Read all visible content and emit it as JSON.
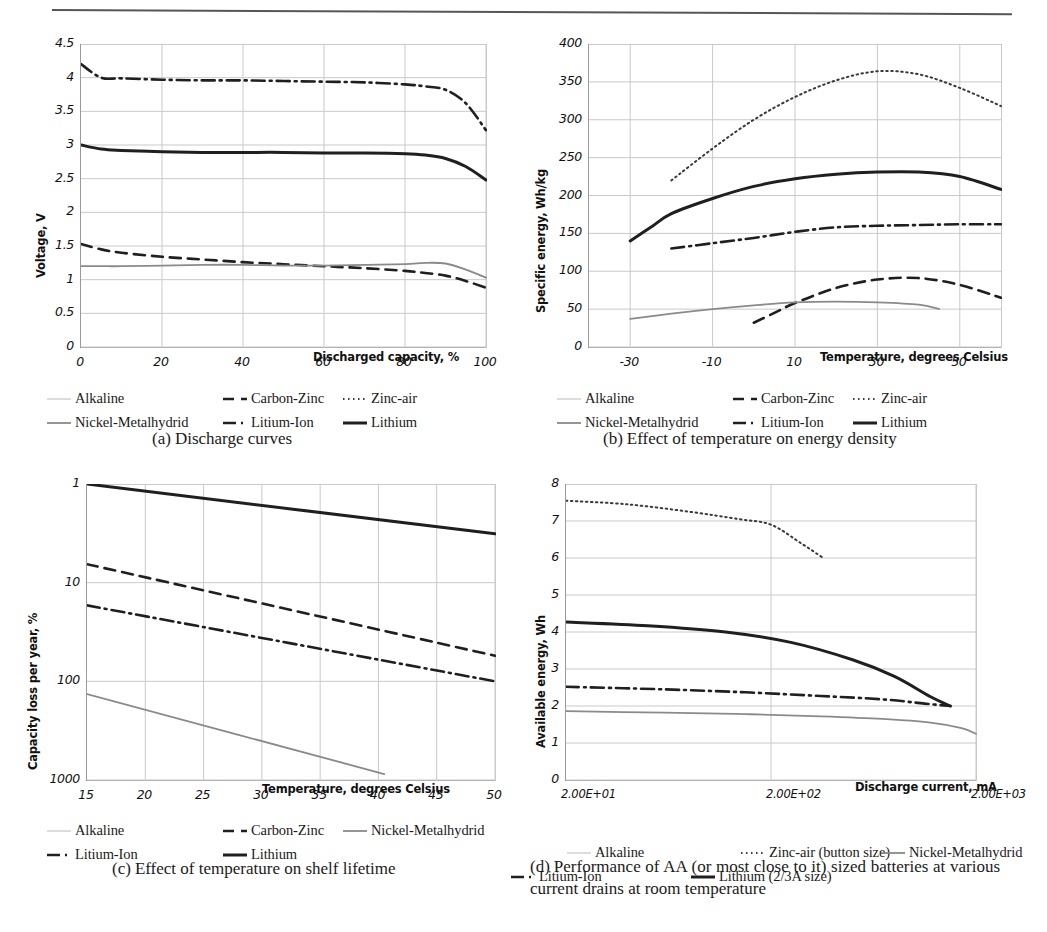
{
  "figure": {
    "has_top_rule": true,
    "colors": {
      "ink": "#1a1a1a",
      "grid": "#c9c9c9",
      "axis": "#9a9a9a",
      "dark_series": "#1f1f1f",
      "grey_series": "#8a8a8a"
    }
  },
  "series_styles": {
    "Alkaline": "faint-solid",
    "Carbon-Zinc": "dashed",
    "Zinc-air": "dotted",
    "Nickel-Metalhydrid": "grey-solid",
    "Litium-Ion": "dash-dot",
    "Lithium": "thick-solid"
  },
  "panels": [
    {
      "key": "a",
      "caption_index": "(a)",
      "caption_text": "Discharge curves",
      "legend": [
        {
          "label": "Alkaline",
          "style": "faint-solid"
        },
        {
          "label": "Carbon-Zinc",
          "style": "dashed"
        },
        {
          "label": "Zinc-air",
          "style": "dotted"
        },
        {
          "label": "Nickel-Metalhydrid",
          "style": "grey-solid"
        },
        {
          "label": "Litium-Ion",
          "style": "dash-dot"
        },
        {
          "label": "Lithium",
          "style": "thick-solid"
        }
      ],
      "chart_data": {
        "type": "line",
        "title": "",
        "xlabel": "Discharged capacity, %",
        "ylabel": "Voltage, V",
        "xlim": [
          0,
          100
        ],
        "ylim": [
          0,
          4.5
        ],
        "xticks": [
          0,
          20,
          40,
          60,
          80,
          100
        ],
        "yticks": [
          0,
          0.5,
          1,
          1.5,
          2,
          2.5,
          3,
          3.5,
          4,
          4.5
        ],
        "grid": true,
        "legend_position": "below",
        "x": [
          0,
          5,
          10,
          20,
          30,
          40,
          50,
          60,
          70,
          80,
          85,
          90,
          95,
          100
        ],
        "series": [
          {
            "name": "Litium-Ion",
            "style": "dash-dot",
            "values": [
              4.2,
              4.0,
              3.99,
              3.97,
              3.96,
              3.96,
              3.95,
              3.94,
              3.93,
              3.9,
              3.87,
              3.82,
              3.62,
              3.22
            ]
          },
          {
            "name": "Lithium",
            "style": "thick-solid",
            "values": [
              3.0,
              2.94,
              2.92,
              2.9,
              2.89,
              2.89,
              2.89,
              2.88,
              2.88,
              2.87,
              2.85,
              2.8,
              2.68,
              2.48
            ]
          },
          {
            "name": "Carbon-Zinc",
            "style": "dashed",
            "values": [
              1.53,
              1.45,
              1.4,
              1.34,
              1.3,
              1.26,
              1.23,
              1.2,
              1.17,
              1.13,
              1.1,
              1.06,
              0.98,
              0.88
            ]
          },
          {
            "name": "Nickel-Metalhydrid",
            "style": "grey-solid",
            "values": [
              1.2,
              1.2,
              1.2,
              1.21,
              1.22,
              1.22,
              1.21,
              1.21,
              1.22,
              1.23,
              1.25,
              1.24,
              1.15,
              1.03
            ]
          }
        ]
      }
    },
    {
      "key": "b",
      "caption_index": "(b)",
      "caption_text": "Effect of temperature on energy density",
      "legend": [
        {
          "label": "Alkaline",
          "style": "faint-solid"
        },
        {
          "label": "Carbon-Zinc",
          "style": "dashed"
        },
        {
          "label": "Zinc-air",
          "style": "dotted"
        },
        {
          "label": "Nickel-Metalhydrid",
          "style": "grey-solid"
        },
        {
          "label": "Litium-Ion",
          "style": "dash-dot"
        },
        {
          "label": "Lithium",
          "style": "thick-solid"
        }
      ],
      "chart_data": {
        "type": "line",
        "title": "",
        "xlabel": "Temperature, degrees Celsius",
        "ylabel": "Specific energy, Wh/kg",
        "xlim": [
          -40,
          60
        ],
        "ylim": [
          0,
          400
        ],
        "xticks": [
          -30,
          -10,
          10,
          30,
          50
        ],
        "yticks": [
          0,
          50,
          100,
          150,
          200,
          250,
          300,
          350,
          400
        ],
        "grid": true,
        "legend_position": "below",
        "series": [
          {
            "name": "Zinc-air",
            "style": "dotted",
            "x": [
              -20,
              -10,
              0,
              10,
              20,
              30,
              40,
              50,
              60
            ],
            "values": [
              220,
              262,
              300,
              330,
              352,
              364,
              360,
              342,
              318
            ]
          },
          {
            "name": "Lithium",
            "style": "thick-solid",
            "x": [
              -30,
              -25,
              -20,
              -10,
              0,
              10,
              20,
              30,
              40,
              50,
              60
            ],
            "values": [
              140,
              158,
              176,
              196,
              212,
              222,
              228,
              231,
              231,
              225,
              208
            ]
          },
          {
            "name": "Litium-Ion",
            "style": "dash-dot",
            "x": [
              -20,
              -10,
              0,
              10,
              20,
              30,
              40,
              50,
              60
            ],
            "values": [
              130,
              137,
              144,
              152,
              158,
              160,
              161,
              162,
              162
            ]
          },
          {
            "name": "Carbon-Zinc",
            "style": "dashed",
            "x": [
              0,
              5,
              10,
              20,
              30,
              40,
              50,
              60
            ],
            "values": [
              32,
              45,
              58,
              78,
              89,
              91,
              82,
              65
            ]
          },
          {
            "name": "Nickel-Metalhydrid",
            "style": "grey-solid",
            "x": [
              -30,
              -20,
              -10,
              0,
              10,
              20,
              30,
              40,
              45
            ],
            "values": [
              37,
              44,
              50,
              55,
              59,
              60,
              59,
              56,
              50
            ]
          }
        ]
      }
    },
    {
      "key": "c",
      "caption_index": "(c)",
      "caption_text": "Effect of temperature on shelf lifetime",
      "legend": [
        {
          "label": "Alkaline",
          "style": "faint-solid"
        },
        {
          "label": "Carbon-Zinc",
          "style": "dashed"
        },
        {
          "label": "Nickel-Metalhydrid",
          "style": "grey-solid"
        },
        {
          "label": "Litium-Ion",
          "style": "dash-dot"
        },
        {
          "label": "Lithium",
          "style": "thick-solid"
        }
      ],
      "chart_data": {
        "type": "line",
        "title": "",
        "xlabel": "Temperature, degrees Celsius",
        "ylabel": "Capacity loss per year, %",
        "xlim": [
          15,
          50
        ],
        "ylim": [
          1,
          1000
        ],
        "yscale": "log-inverted",
        "xticks": [
          15,
          20,
          25,
          30,
          35,
          40,
          45,
          50
        ],
        "yticks": [
          1,
          10,
          100,
          1000
        ],
        "grid": true,
        "legend_position": "below",
        "series": [
          {
            "name": "Lithium",
            "style": "thick-solid",
            "x": [
              15,
              50
            ],
            "values": [
              1.0,
              3.2
            ]
          },
          {
            "name": "Carbon-Zinc",
            "style": "dashed",
            "x": [
              15,
              50
            ],
            "values": [
              6.5,
              55
            ]
          },
          {
            "name": "Litium-Ion",
            "style": "dash-dot",
            "x": [
              15,
              50
            ],
            "values": [
              17,
              100
            ]
          },
          {
            "name": "Nickel-Metalhydrid",
            "style": "grey-solid",
            "x": [
              15,
              40.5
            ],
            "values": [
              135,
              870
            ]
          }
        ]
      }
    },
    {
      "key": "d",
      "caption_index": "(d)",
      "caption_text": "Performance of AA (or most close to it) sized batteries at various current drains at room temperature",
      "legend": [
        {
          "label": "Alkaline",
          "style": "faint-solid"
        },
        {
          "label": "Zinc-air (button size)",
          "style": "dotted"
        },
        {
          "label": "Nickel-Metalhydrid",
          "style": "grey-solid"
        },
        {
          "label": "Litium-Ion",
          "style": "dash-dot"
        },
        {
          "label": "Lithium (2/3A size)",
          "style": "thick-solid"
        }
      ],
      "chart_data": {
        "type": "line",
        "title": "",
        "xlabel": "Discharge current, mA",
        "ylabel": "Available energy, Wh",
        "xscale": "log",
        "xlim": [
          20,
          2000
        ],
        "ylim": [
          0,
          8
        ],
        "xticks": [
          "2.00E+01",
          "2.00E+02",
          "2.00E+03"
        ],
        "xtick_values": [
          20,
          200,
          2000
        ],
        "yticks": [
          0,
          1,
          2,
          3,
          4,
          5,
          6,
          7,
          8
        ],
        "grid": true,
        "legend_position": "below",
        "series": [
          {
            "name": "Zinc-air (button size)",
            "style": "dotted",
            "x": [
              20,
              40,
              80,
              140,
              200,
              280,
              360
            ],
            "values": [
              7.55,
              7.45,
              7.25,
              7.05,
              6.9,
              6.4,
              6.0
            ]
          },
          {
            "name": "Lithium (2/3A size)",
            "style": "thick-solid",
            "x": [
              20,
              50,
              120,
              250,
              500,
              800,
              1200,
              1500
            ],
            "values": [
              4.27,
              4.17,
              4.0,
              3.72,
              3.25,
              2.8,
              2.25,
              2.0
            ]
          },
          {
            "name": "Litium-Ion",
            "style": "dash-dot",
            "x": [
              20,
              60,
              150,
              350,
              700,
              1100,
              1500
            ],
            "values": [
              2.52,
              2.45,
              2.37,
              2.27,
              2.18,
              2.07,
              2.0
            ]
          },
          {
            "name": "Nickel-Metalhydrid",
            "style": "grey-solid",
            "x": [
              20,
              60,
              150,
              350,
              700,
              1200,
              1700,
              2000
            ],
            "values": [
              1.86,
              1.82,
              1.78,
              1.72,
              1.65,
              1.55,
              1.4,
              1.25
            ]
          }
        ]
      }
    }
  ]
}
